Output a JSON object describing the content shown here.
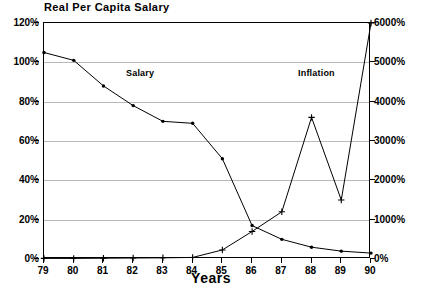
{
  "chart_data": {
    "type": "line",
    "title": "Real Per Capita Salary",
    "xlabel": "Years",
    "ylabel": "",
    "grid": true,
    "legend_position": "in-plot-annotation",
    "x": [
      "79",
      "80",
      "81",
      "82",
      "83",
      "84",
      "85",
      "86",
      "87",
      "88",
      "89",
      "90"
    ],
    "categories": [
      "79",
      "80",
      "81",
      "82",
      "83",
      "84",
      "85",
      "86",
      "87",
      "88",
      "89",
      "90"
    ],
    "axes": {
      "left": {
        "label": "",
        "ylim": [
          0,
          120
        ],
        "ticks": [
          0,
          20,
          40,
          60,
          80,
          100,
          120
        ],
        "tick_labels": [
          "0%",
          "20%",
          "40%",
          "60%",
          "80%",
          "100%",
          "120%"
        ],
        "series": "Salary"
      },
      "right": {
        "label": "",
        "ylim": [
          0,
          6000
        ],
        "ticks": [
          0,
          1000,
          2000,
          3000,
          4000,
          5000,
          6000
        ],
        "tick_labels": [
          "0%",
          "1000%",
          "2000%",
          "3000%",
          "4000%",
          "5000%",
          "6000%"
        ],
        "series": "Inflation"
      }
    },
    "series": [
      {
        "name": "Salary",
        "axis": "left",
        "marker": "dot",
        "unit": "%",
        "annotation": "Salary",
        "values": [
          105,
          101,
          88,
          78,
          70,
          69,
          51,
          17,
          10,
          6,
          4,
          3
        ]
      },
      {
        "name": "Inflation",
        "axis": "right",
        "marker": "plus",
        "unit": "%",
        "annotation": "Inflation",
        "values": [
          15,
          15,
          20,
          25,
          30,
          40,
          230,
          700,
          1200,
          3600,
          1500,
          6000
        ]
      }
    ]
  }
}
